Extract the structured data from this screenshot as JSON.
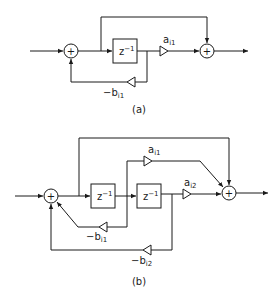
{
  "diagram_a": {
    "caption": "(a)",
    "delay_label": "z",
    "delay_exp": "−1",
    "gain_forward": {
      "base": "a",
      "sub": "i1"
    },
    "gain_feedback": {
      "base": "−b",
      "sub": "i1"
    },
    "adder_symbol": "+"
  },
  "diagram_b": {
    "caption": "(b)",
    "delay1_label": "z",
    "delay1_exp": "−1",
    "delay2_label": "z",
    "delay2_exp": "−1",
    "gain_forward_1": {
      "base": "a",
      "sub": "i1"
    },
    "gain_forward_2": {
      "base": "a",
      "sub": "i2"
    },
    "gain_feedback_1": {
      "base": "−b",
      "sub": "i1"
    },
    "gain_feedback_2": {
      "base": "−b",
      "sub": "i2"
    },
    "adder_symbol": "+"
  }
}
